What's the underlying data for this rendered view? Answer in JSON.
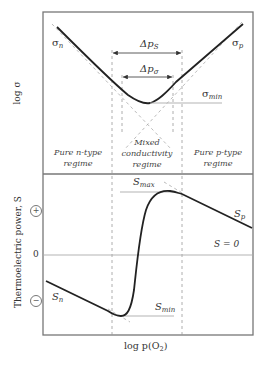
{
  "figure": {
    "top_panel": {
      "y_axis_label": "log σ",
      "curve_left_label": "σ",
      "curve_left_sub": "n",
      "curve_right_label": "σ",
      "curve_right_sub": "p",
      "min_label": "σ",
      "min_sub": "min",
      "arrow_outer_label": "Δp",
      "arrow_outer_sub": "S",
      "arrow_inner_label": "Δp",
      "arrow_inner_sub": "σ",
      "regimes": [
        {
          "line1": "Pure n-type",
          "line2": "regime"
        },
        {
          "line1": "Mixed",
          "line2": "conductivity",
          "line3": "regime"
        },
        {
          "line1": "Pure p-type",
          "line2": "regime"
        }
      ]
    },
    "bottom_panel": {
      "y_axis_label": "Thermoelectric power, S",
      "plus_sign": "+",
      "minus_sign": "−",
      "zero_label": "0",
      "zero_line_label": "S = 0",
      "max_label": "S",
      "max_sub": "max",
      "min_label": "S",
      "min_sub": "min",
      "left_label": "S",
      "left_sub": "n",
      "right_label": "S",
      "right_sub": "p"
    },
    "x_axis_label_prefix": "log p(O",
    "x_axis_label_sub": "2",
    "x_axis_label_suffix": ")",
    "colors": {
      "frame": "#777777",
      "curve": "#222222",
      "dashed": "#999999",
      "reference_line": "#aaaaaa"
    }
  }
}
